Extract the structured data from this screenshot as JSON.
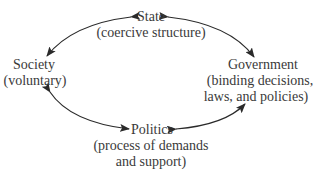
{
  "diagram": {
    "type": "cycle",
    "nodes": {
      "state": {
        "title": "State",
        "subtitle_lines": [
          "(coercive structure)"
        ]
      },
      "society": {
        "title": "Society",
        "subtitle_lines": [
          "(voluntary)"
        ]
      },
      "government": {
        "title": "Government",
        "subtitle_lines": [
          "(binding decisions,",
          "laws, and policies)"
        ]
      },
      "politics": {
        "title": "Politics",
        "subtitle_lines": [
          "(process of demands",
          "and support)"
        ]
      }
    },
    "edges": [
      {
        "from": "state",
        "to": "society",
        "direction": "bidirectional"
      },
      {
        "from": "state",
        "to": "government",
        "direction": "bidirectional"
      },
      {
        "from": "society",
        "to": "politics",
        "direction": "bidirectional"
      },
      {
        "from": "politics",
        "to": "government",
        "direction": "bidirectional"
      }
    ],
    "colors": {
      "text": "#3a3a3a",
      "arrow": "#2a2a2a",
      "background": "#ffffff"
    }
  }
}
